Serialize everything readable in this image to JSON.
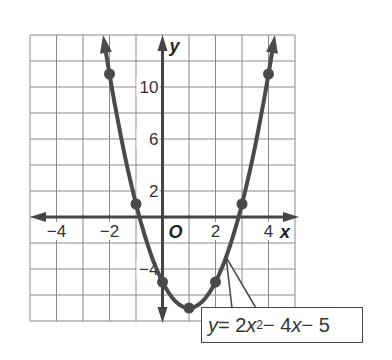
{
  "chart_data": {
    "type": "line",
    "title": "",
    "xlabel": "x",
    "ylabel": "y",
    "origin_label": "O",
    "xlim": [
      -5,
      5
    ],
    "ylim": [
      -8,
      14
    ],
    "grid": true,
    "x_grid_step": 1,
    "y_grid_step": 2,
    "x_tick_labels": [
      {
        "value": -4,
        "label": "−4"
      },
      {
        "value": -2,
        "label": "−2"
      },
      {
        "value": 2,
        "label": "2"
      },
      {
        "value": 4,
        "label": "4"
      }
    ],
    "y_tick_labels": [
      {
        "value": 10,
        "label": "10"
      },
      {
        "value": 6,
        "label": "6"
      },
      {
        "value": 2,
        "label": "2"
      },
      {
        "value": -4,
        "label": "−4"
      }
    ],
    "series": [
      {
        "name": "y = 2x^2 - 4x - 5",
        "function": "2x^2 - 4x - 5",
        "x": [
          -2,
          -1,
          0,
          1,
          2,
          3,
          4
        ],
        "values": [
          11,
          1,
          -5,
          -7,
          -5,
          1,
          11
        ],
        "color": "#4a4a4a"
      }
    ],
    "annotation": {
      "text_prefix": "y",
      "text_eq": " = 2",
      "text_var": "x",
      "text_exp": "2",
      "text_rest": " − 4",
      "text_var2": "x",
      "text_tail": " − 5",
      "points_to_x": 2.4
    }
  }
}
